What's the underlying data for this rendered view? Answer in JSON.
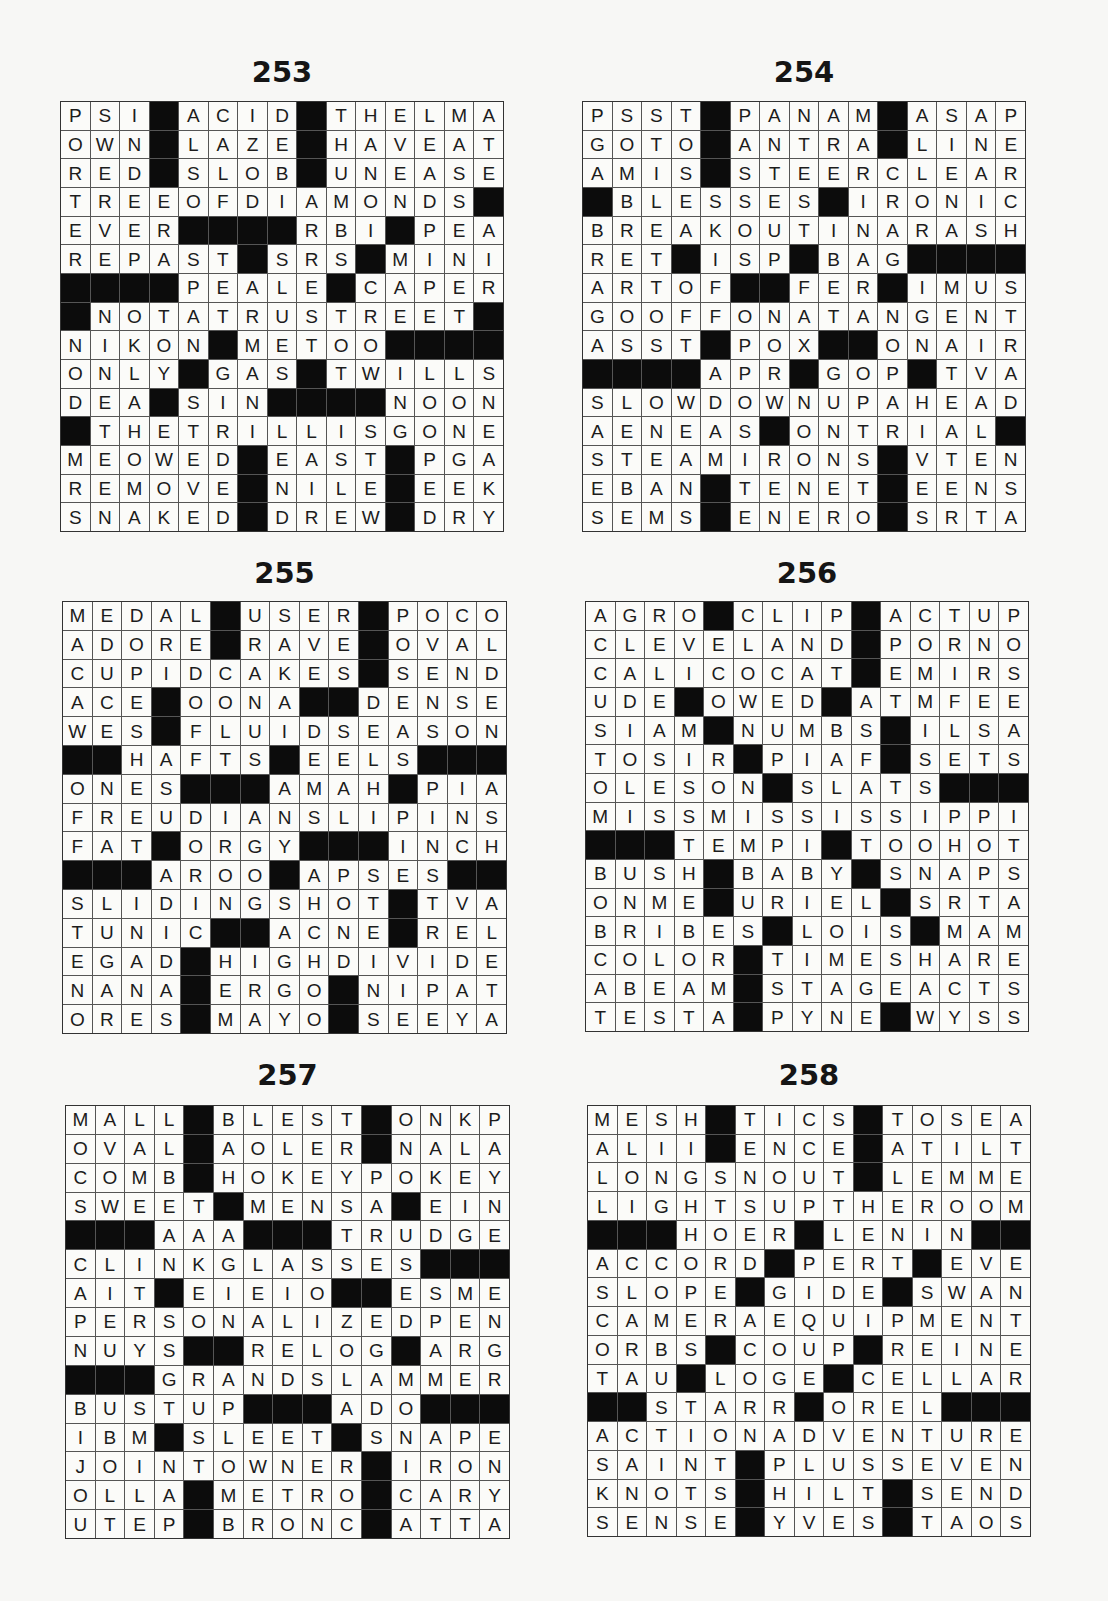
{
  "page": {
    "background": "#f7f7f5",
    "block_color": "#0c0c0c"
  },
  "puzzles": [
    {
      "number": "253",
      "rows": [
        "PSI#ACID#THELMA",
        "OWN#LAZE#HAVEAT",
        "RED#SLOB#UNEASE",
        "TREEOFDIAMONDS#",
        "EVER####RBI#PEA",
        "REPAST#SRS#MINI",
        "####PEALE#CAPER",
        "#NOTATRUSTREET#",
        "NIKON#METOO####",
        "ONLY#GAS#TWILLS",
        "DEA#SIN####NOON",
        "#THETRILLISGONE",
        "MEOWED#EAST#PGA",
        "REMOVE#NILE#EEK",
        "SNAKED#DREW#DRY"
      ]
    },
    {
      "number": "254",
      "rows": [
        "PSST#PANAM#ASAP",
        "GOTO#ANTRA#LINE",
        "AMIS#STEERCLEAR",
        "#BLESSES#IRONIC",
        "BREAKOUTINARASH",
        "RET#ISP#BAG####",
        "ARTOF##FER#IMUS",
        "GOOFFONATANGENT",
        "ASST#POX##ONAIR",
        "####APR#GOP#TVA",
        "SLOWDOWNUPAHEAD",
        "AENEAS#ONTRIAL#",
        "STEAMIRONS#VTEN",
        "EBAN#TENET#EENS",
        "SEMS#ENERO#SRTA"
      ]
    },
    {
      "number": "255",
      "rows": [
        "MEDAL#USER#POCO",
        "ADORE#RAVE#OVAL",
        "CUPIDCAKES#SEND",
        "ACE#OONA##DENSE",
        "WES#FLUIDSEASON",
        "##HAFTS#EELS###",
        "ONES###AMAH#PIA",
        "FREUDIANSLIPINS",
        "FAT#ORGY###INCH",
        "###AROO#APSES##",
        "SLIDINGSHOT#TVA",
        "TUNIC##ACNE#REL",
        "EGAD#HIGHDIVIDE",
        "NANA#ERGO#NIPAT",
        "ORES#MAYO#SEEYA"
      ]
    },
    {
      "number": "256",
      "rows": [
        "AGRO#CLIP#ACTUP",
        "CLEVELAND#PORNO",
        "CALICOCAT#EMIRS",
        "UDE#OWED#ATMFEE",
        "SIAM#NUMBS#ILSA",
        "TOSIR#PIAF#SETS",
        "OLESON#SLATS###",
        "MISSMISSISSIPPI",
        "###TEMPI#TOOHOT",
        "BUSH#BABY#SNAPS",
        "ONME#URIEL#SRTA",
        "BRIBES#LOIS#MAM",
        "COLOR#TIMESHARE",
        "ABEAM#STAGEACTS",
        "TESTA#PYNE#WYSS"
      ]
    },
    {
      "number": "257",
      "rows": [
        "MALL#BLEST#ONKP",
        "OVAL#AOLER#NALA",
        "COMB#HOKEYPOKEY",
        "SWEET#MENSA#EIN",
        "###AAA###TRUDGE",
        "CLINKGLASSES###",
        "AIT#EIEIO##ESME",
        "PERSONALIZEDPEN",
        "NUYS##RELOG#ARG",
        "###GRANDSLAMMER",
        "BUSTUP###ADO###",
        "IBM#SLEET#SNAPE",
        "JOINTOWNER#IRON",
        "OLLA#METRO#CARY",
        "UTEP#BRONC#ATTA"
      ]
    },
    {
      "number": "258",
      "rows": [
        "MESH#TICS#TOSEA",
        "ALII#ENCE#ATILT",
        "LONGSNOUT#LEMME",
        "LIGHTSUPTHEROOM",
        "###HOER#LENIN##",
        "ACCORD#PERT#EVE",
        "SLOPE#GIDE#SWAN",
        "CAMERAEQUIPMENT",
        "ORBS#COUP#REINE",
        "TAU#LOGE#CELLAR",
        "##STARR#OREL###",
        "ACTIONADVENTURE",
        "SAINT#PLUSSEVEN",
        "KNOTS#HILT#SEND",
        "SENSE#YVES#TAOS"
      ]
    }
  ]
}
